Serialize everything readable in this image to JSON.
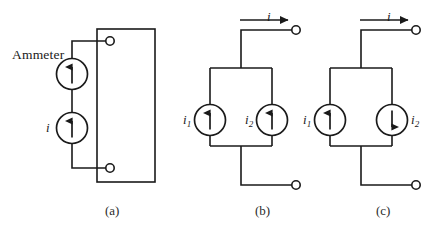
{
  "figure": {
    "background_color": "#ffffff",
    "line_color": "#1a1a1a",
    "panel_count": 3
  },
  "panels": [
    {
      "id": "a",
      "caption": "(a)",
      "description": "Two current sources in series connected to a two-terminal box",
      "labels": {
        "ammeter": "Ammeter",
        "current": "i"
      },
      "sources": [
        {
          "name": "upper-source",
          "arrow": "up",
          "label": ""
        },
        {
          "name": "lower-source",
          "arrow": "up",
          "label": "i"
        }
      ],
      "terminals": 2,
      "has_box": true
    },
    {
      "id": "b",
      "caption": "(b)",
      "description": "Two current sources in parallel, both arrows up",
      "labels": {
        "current": "i",
        "source1": "i",
        "source1_sub": "1",
        "source2": "i",
        "source2_sub": "2"
      },
      "sources": [
        {
          "name": "source-i1",
          "arrow": "up",
          "label_side": "left"
        },
        {
          "name": "source-i2",
          "arrow": "up",
          "label_side": "left"
        }
      ],
      "terminals": 2,
      "has_box": false
    },
    {
      "id": "c",
      "caption": "(c)",
      "description": "Two current sources in parallel, first arrow up, second arrow down",
      "labels": {
        "current": "i",
        "source1": "i",
        "source1_sub": "1",
        "source2": "i",
        "source2_sub": "2"
      },
      "sources": [
        {
          "name": "source-i1",
          "arrow": "up",
          "label_side": "left"
        },
        {
          "name": "source-i2",
          "arrow": "down",
          "label_side": "right"
        }
      ],
      "terminals": 2,
      "has_box": false
    }
  ]
}
